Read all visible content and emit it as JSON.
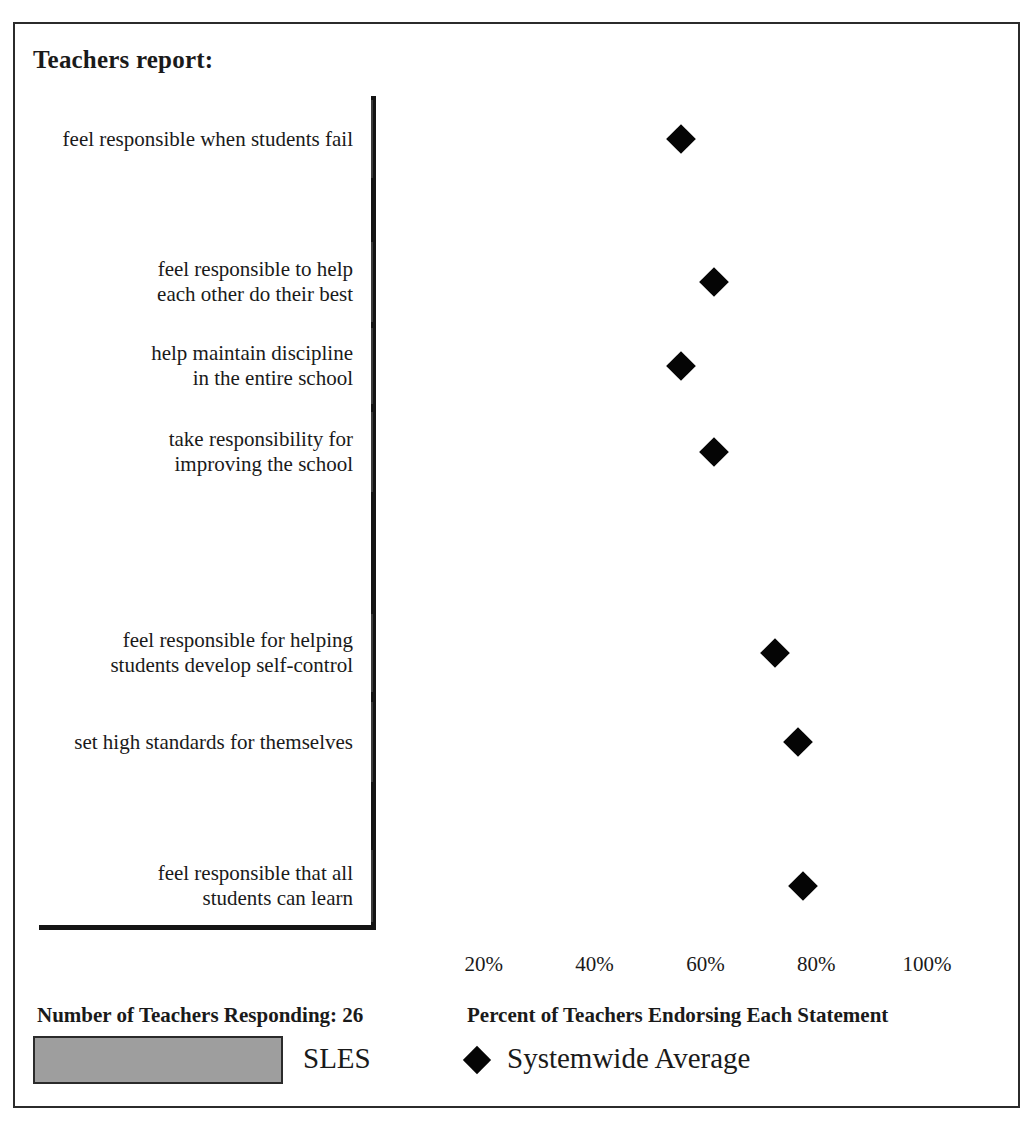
{
  "chart_data": {
    "type": "bar",
    "title": "Teachers report:",
    "orientation": "horizontal",
    "xlabel": "Percent of Teachers Endorsing Each Statement",
    "ylabel": "",
    "xlim": [
      0,
      110
    ],
    "grid": false,
    "tick_labels": [
      "20%",
      "40%",
      "60%",
      "80%",
      "100%"
    ],
    "tick_values": [
      20,
      40,
      60,
      80,
      100
    ],
    "legend_position": "bottom",
    "categories": [
      "feel responsible when students fail",
      "feel responsible to help\neach other do their best",
      "help maintain discipline\nin the entire school",
      "take responsibility for\nimproving the school",
      "feel responsible for helping\nstudents develop self-control",
      "set high standards for themselves",
      "feel responsible that all\nstudents can learn"
    ],
    "series": [
      {
        "name": "SLES",
        "kind": "bar",
        "color": "#9e9e9e",
        "values": [
          60,
          67,
          54,
          83,
          86,
          100,
          94
        ]
      },
      {
        "name": "Systemwide Average",
        "kind": "marker",
        "marker": "diamond",
        "color": "#050505",
        "values": [
          56,
          62,
          56,
          62,
          73,
          77,
          78
        ]
      }
    ]
  },
  "footer": {
    "respondents": "Number of Teachers Responding: 26",
    "axis_caption": "Percent of Teachers Endorsing Each Statement"
  },
  "legend": {
    "series_label": "SLES",
    "marker_label": "Systemwide Average"
  },
  "colors": {
    "bar_fill": "#9e9e9e",
    "bar_stroke": "#3a3a3a",
    "marker": "#050505",
    "frame": "#2b2b2b",
    "axis": "#141414"
  }
}
